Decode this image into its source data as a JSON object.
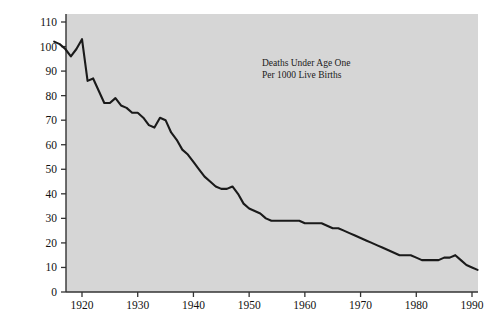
{
  "chart_data": {
    "type": "line",
    "title": "",
    "subtitle": "",
    "xlabel": "",
    "ylabel": "",
    "annotation": {
      "line1": "Deaths Under Age One",
      "line2": "Per 1000 Live Births"
    },
    "xlim": [
      1913,
      1993
    ],
    "ylim": [
      0,
      113
    ],
    "grid": false,
    "legend": "none",
    "x_ticks": [
      1920,
      1930,
      1940,
      1950,
      1960,
      1970,
      1980,
      1990
    ],
    "x_tick_labels": [
      "1920",
      "1930",
      "1940",
      "1950",
      "1960",
      "1970",
      "1980",
      "1990"
    ],
    "y_ticks": [
      0,
      10,
      20,
      30,
      40,
      50,
      60,
      70,
      80,
      90,
      100,
      110
    ],
    "y_tick_labels": [
      "0",
      "10",
      "20",
      "30",
      "40",
      "50",
      "60",
      "70",
      "80",
      "90",
      "100",
      "110"
    ],
    "series": [
      {
        "name": "Infant mortality rate",
        "color": "#1a1a1a",
        "x": [
          1915,
          1916,
          1917,
          1918,
          1919,
          1920,
          1921,
          1922,
          1923,
          1924,
          1925,
          1926,
          1927,
          1928,
          1929,
          1930,
          1931,
          1932,
          1933,
          1934,
          1935,
          1936,
          1937,
          1938,
          1939,
          1940,
          1941,
          1942,
          1943,
          1944,
          1945,
          1946,
          1947,
          1948,
          1949,
          1950,
          1951,
          1952,
          1953,
          1954,
          1955,
          1956,
          1957,
          1958,
          1959,
          1960,
          1961,
          1962,
          1963,
          1964,
          1965,
          1966,
          1967,
          1968,
          1969,
          1970,
          1971,
          1972,
          1973,
          1974,
          1975,
          1976,
          1977,
          1978,
          1979,
          1980,
          1981,
          1982,
          1983,
          1984,
          1985,
          1986,
          1987,
          1988,
          1989,
          1990,
          1991
        ],
        "values": [
          102,
          101,
          99,
          96,
          99,
          103,
          86,
          87,
          82,
          77,
          77,
          79,
          76,
          75,
          73,
          73,
          71,
          68,
          67,
          71,
          70,
          65,
          62,
          58,
          56,
          53,
          50,
          47,
          45,
          43,
          42,
          42,
          43,
          40,
          36,
          34,
          33,
          32,
          30,
          29,
          29,
          29,
          29,
          29,
          29,
          28,
          28,
          28,
          28,
          27,
          26,
          26,
          25,
          24,
          23,
          22,
          21,
          20,
          19,
          18,
          17,
          16,
          15,
          15,
          15,
          14,
          13,
          13,
          13,
          13,
          14,
          14,
          15,
          13,
          11,
          10,
          9
        ]
      }
    ]
  },
  "panel": {
    "background_color": "#d6d6d6",
    "axis_color": "#333333",
    "page_background_color": "#ffffff"
  }
}
